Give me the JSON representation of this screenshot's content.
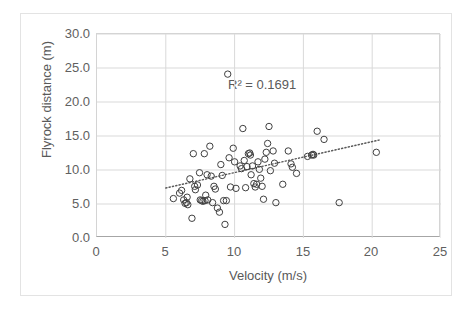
{
  "chart_data": {
    "type": "scatter",
    "title": "",
    "xlabel": "Velocity (m/s)",
    "ylabel": "Flyrock distance (m)",
    "xlim": [
      0,
      25
    ],
    "ylim": [
      0,
      30
    ],
    "xticks": [
      "0",
      "5",
      "10",
      "15",
      "20",
      "25"
    ],
    "xtick_values": [
      0,
      5,
      10,
      15,
      20,
      25
    ],
    "yticks": [
      "0.0",
      "5.0",
      "10.0",
      "15.0",
      "20.0",
      "25.0",
      "30.0"
    ],
    "ytick_values": [
      0,
      5,
      10,
      15,
      20,
      25,
      30
    ],
    "grid": true,
    "grid_axis": "both",
    "legend": false,
    "marker": "open-circle",
    "marker_color": "#404040",
    "annotations": [
      {
        "text": "R² = 0.1691",
        "x": 12.6,
        "y": 23.5
      }
    ],
    "trendline": {
      "type": "linear-dotted",
      "x_start": 5.0,
      "y_start": 7.35,
      "x_end": 20.5,
      "y_end": 14.4,
      "color": "#5a5a5a"
    },
    "series": [
      {
        "name": "Flyrock observations",
        "points": [
          [
            5.55,
            5.8
          ],
          [
            6.0,
            6.6
          ],
          [
            6.15,
            7.0
          ],
          [
            6.3,
            5.6
          ],
          [
            6.4,
            5.1
          ],
          [
            6.5,
            5.2
          ],
          [
            6.55,
            6.0
          ],
          [
            6.6,
            4.9
          ],
          [
            6.75,
            8.7
          ],
          [
            6.9,
            2.9
          ],
          [
            7.0,
            12.4
          ],
          [
            7.1,
            7.6
          ],
          [
            7.15,
            7.1
          ],
          [
            7.3,
            7.8
          ],
          [
            7.45,
            9.6
          ],
          [
            7.5,
            5.6
          ],
          [
            7.6,
            5.5
          ],
          [
            7.7,
            5.4
          ],
          [
            7.8,
            12.4
          ],
          [
            7.85,
            5.5
          ],
          [
            7.9,
            6.3
          ],
          [
            8.0,
            9.3
          ],
          [
            8.05,
            5.6
          ],
          [
            8.2,
            13.5
          ],
          [
            8.3,
            9.1
          ],
          [
            8.4,
            5.2
          ],
          [
            8.5,
            7.6
          ],
          [
            8.6,
            7.2
          ],
          [
            8.75,
            4.4
          ],
          [
            8.9,
            3.8
          ],
          [
            9.0,
            10.8
          ],
          [
            9.1,
            9.2
          ],
          [
            9.2,
            5.5
          ],
          [
            9.3,
            2.0
          ],
          [
            9.4,
            5.5
          ],
          [
            9.5,
            24.1
          ],
          [
            9.6,
            11.8
          ],
          [
            9.7,
            7.5
          ],
          [
            9.9,
            13.2
          ],
          [
            10.0,
            11.2
          ],
          [
            10.1,
            7.3
          ],
          [
            10.4,
            10.6
          ],
          [
            10.5,
            10.2
          ],
          [
            10.6,
            16.1
          ],
          [
            10.7,
            11.4
          ],
          [
            10.8,
            7.4
          ],
          [
            10.9,
            10.5
          ],
          [
            11.0,
            12.4
          ],
          [
            11.1,
            12.5
          ],
          [
            11.15,
            12.2
          ],
          [
            11.2,
            9.3
          ],
          [
            11.3,
            10.6
          ],
          [
            11.4,
            8.0
          ],
          [
            11.5,
            7.5
          ],
          [
            11.6,
            7.9
          ],
          [
            11.7,
            11.2
          ],
          [
            11.8,
            10.1
          ],
          [
            11.9,
            8.8
          ],
          [
            12.0,
            7.6
          ],
          [
            12.1,
            5.7
          ],
          [
            12.2,
            11.6
          ],
          [
            12.3,
            12.6
          ],
          [
            12.4,
            13.9
          ],
          [
            12.5,
            16.4
          ],
          [
            12.6,
            9.9
          ],
          [
            12.8,
            12.8
          ],
          [
            12.9,
            11.0
          ],
          [
            13.0,
            5.2
          ],
          [
            13.5,
            7.9
          ],
          [
            13.9,
            12.8
          ],
          [
            14.1,
            10.9
          ],
          [
            14.2,
            10.4
          ],
          [
            14.5,
            9.5
          ],
          [
            15.3,
            12.0
          ],
          [
            15.6,
            12.2
          ],
          [
            15.7,
            12.3
          ],
          [
            15.75,
            12.2
          ],
          [
            16.0,
            15.7
          ],
          [
            16.5,
            14.5
          ],
          [
            17.6,
            5.2
          ],
          [
            20.3,
            12.6
          ]
        ]
      }
    ]
  }
}
